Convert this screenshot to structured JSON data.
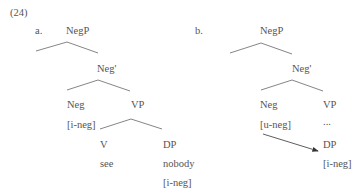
{
  "example_number": "(24)",
  "tree_a": {
    "label": "a.",
    "root": "NegP",
    "bar": "Neg'",
    "head": "Neg",
    "head_feature": "[i-neg]",
    "complement": "VP",
    "verb": "V",
    "verb_word": "see",
    "object": "DP",
    "object_word": "nobody",
    "object_feature": "[i-neg]"
  },
  "tree_b": {
    "label": "b.",
    "root": "NegP",
    "bar": "Neg'",
    "head": "Neg",
    "head_feature": "[u-neg]",
    "complement": "VP",
    "ellipsis": "...",
    "object": "DP",
    "object_feature": "[i-neg]"
  },
  "colors": {
    "text": "#555555",
    "lines": "#666666",
    "arrow": "#333333"
  }
}
